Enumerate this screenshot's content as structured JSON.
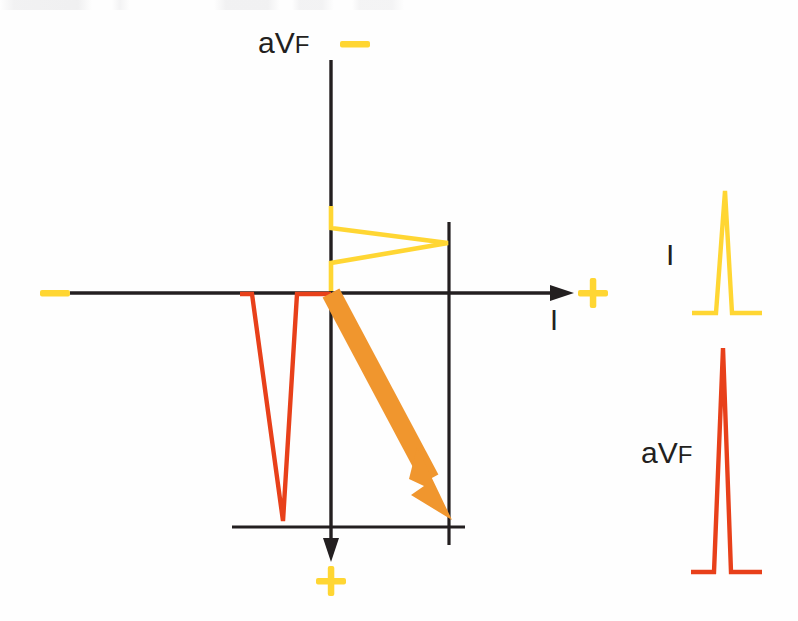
{
  "colors": {
    "axis": "#231f20",
    "lead_i_trace": "#FFD633",
    "lead_avf_trace": "#E8401A",
    "vector_arrow": "#F0962E",
    "polarity_sign": "#FFD633",
    "background": "#FEFEFE"
  },
  "axes": {
    "vertical": {
      "lead_label": "aVF",
      "negative_sign": "−",
      "positive_sign": "+",
      "negative_end": "top",
      "positive_end": "bottom",
      "origin_x": 331,
      "top_y": 60,
      "bottom_y": 560
    },
    "horizontal": {
      "lead_label": "I",
      "negative_sign": "−",
      "positive_sign": "+",
      "negative_end": "left",
      "positive_end": "right",
      "origin_y": 293,
      "left_x": 70,
      "right_x": 572
    },
    "reference_lines": {
      "vertical_reference_x": 449,
      "vertical_reference_top_y": 222,
      "vertical_reference_bottom_y": 545,
      "horizontal_reference_y": 527,
      "horizontal_reference_left_x": 232,
      "horizontal_reference_right_x": 465
    }
  },
  "plot_traces": {
    "lead_i_projection": {
      "name": "Lead I QRS projected on horizontal axis",
      "color": "#FFD633",
      "direction": "positive (rightward)",
      "amplitude_px": 118,
      "points": "331,206 331,228 448,243 331,263 331,291"
    },
    "lead_avf_projection": {
      "name": "Lead aVF QRS projected on vertical axis",
      "color": "#E8401A",
      "direction": "negative (downward on plot = positive aVF)",
      "amplitude_px": 228,
      "points": "240,294 252,294 283,521 297,294 331,294"
    },
    "mean_vector": {
      "name": "Mean QRS vector",
      "color": "#F0962E",
      "from": "331,293",
      "to": "452,520",
      "quadrant": "lower-right (normal axis)"
    }
  },
  "lead_strips": [
    {
      "label": "I",
      "color": "#FFD633",
      "deflection": "upright R wave",
      "baseline_y": 313,
      "peak_y": 191,
      "points": "692,313 716,313 725,191 732,313 762,313"
    },
    {
      "label": "aVF",
      "color": "#E8401A",
      "deflection": "upright R wave",
      "baseline_y": 572,
      "peak_y": 348,
      "points": "691,572 714,572 723,348 731,572 762,572"
    }
  ]
}
